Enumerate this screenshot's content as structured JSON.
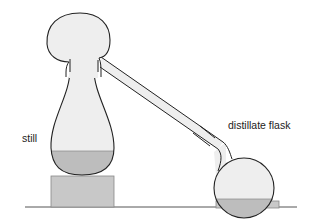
{
  "diagram": {
    "type": "distillation apparatus",
    "labels": {
      "still": "still",
      "distillate_flask": "distillate flask"
    },
    "colors": {
      "glass_fill": "#eeeeee",
      "liquid_fill": "#bdbdbd",
      "stand_fill": "#c8c8c8",
      "outline": "#222222",
      "ground": "#555555"
    }
  }
}
